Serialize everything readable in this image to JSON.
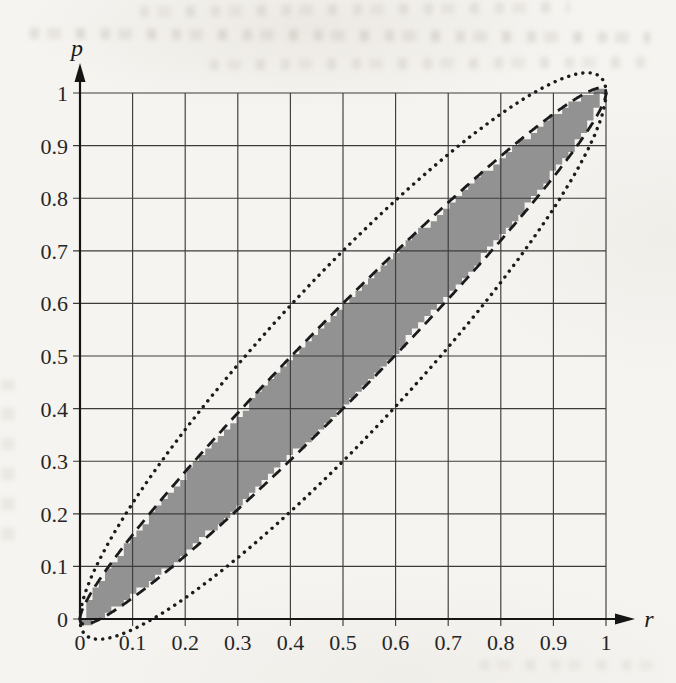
{
  "chart_data": {
    "type": "area",
    "title": "",
    "xlabel": "r",
    "ylabel": "p",
    "xlim": [
      0,
      1
    ],
    "ylim": [
      0,
      1
    ],
    "grid": true,
    "grid_step": 0.1,
    "x_ticks": [
      "0",
      "0.1",
      "0.2",
      "0.3",
      "0.4",
      "0.5",
      "0.6",
      "0.7",
      "0.8",
      "0.9",
      "1"
    ],
    "y_ticks": [
      "0",
      "0.1",
      "0.2",
      "0.3",
      "0.4",
      "0.5",
      "0.6",
      "0.7",
      "0.8",
      "0.9",
      "1"
    ],
    "legend_position": "none",
    "band_formula": "p = r ± c·√(r(1−r))",
    "sample_r": [
      0,
      0.1,
      0.2,
      0.3,
      0.4,
      0.5,
      0.6,
      0.7,
      0.8,
      0.9,
      1
    ],
    "series": [
      {
        "name": "shaded-inner-band",
        "style": "filled-jagged",
        "fill": "#929292",
        "c": 0.2,
        "upper": [
          0,
          0.16,
          0.28,
          0.392,
          0.498,
          0.6,
          0.698,
          0.792,
          0.88,
          0.96,
          1
        ],
        "lower": [
          0,
          0.04,
          0.12,
          0.208,
          0.302,
          0.4,
          0.502,
          0.608,
          0.72,
          0.84,
          1
        ]
      },
      {
        "name": "dashed-inner-boundary",
        "style": "dashed",
        "color": "#1b1b1b",
        "c": 0.2,
        "upper": [
          0,
          0.16,
          0.28,
          0.392,
          0.498,
          0.6,
          0.698,
          0.792,
          0.88,
          0.96,
          1
        ],
        "lower": [
          0,
          0.04,
          0.12,
          0.208,
          0.302,
          0.4,
          0.502,
          0.608,
          0.72,
          0.84,
          1
        ]
      },
      {
        "name": "dotted-outer-boundary",
        "style": "dotted",
        "color": "#1b1b1b",
        "c": 0.4,
        "upper": [
          0,
          0.22,
          0.36,
          0.483,
          0.596,
          0.7,
          0.796,
          0.883,
          0.96,
          1.02,
          1
        ],
        "lower": [
          0,
          -0.02,
          0.04,
          0.117,
          0.204,
          0.3,
          0.404,
          0.517,
          0.64,
          0.78,
          1
        ]
      }
    ]
  },
  "style": {
    "paper_color": "#f6f4f0",
    "grid_color": "#3c3c3c",
    "axis_color": "#151515",
    "label_color": "#262626",
    "shade_color": "#929292",
    "curve_color": "#1b1b1b"
  }
}
